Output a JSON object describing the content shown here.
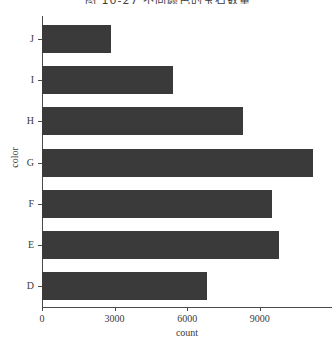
{
  "chart_data": {
    "type": "bar",
    "orientation": "horizontal",
    "title": "图 10-27   不同颜色的宝石数量",
    "xlabel": "count",
    "ylabel": "color",
    "categories": [
      "J",
      "I",
      "H",
      "G",
      "F",
      "E",
      "D"
    ],
    "values": [
      2870,
      5400,
      8300,
      11200,
      9500,
      9790,
      6810
    ],
    "xticks": [
      0,
      3000,
      6000,
      9000
    ],
    "xtick_labels": [
      "0",
      "3000",
      "6000",
      "9000"
    ],
    "xlim": [
      0,
      11900
    ],
    "grid": false,
    "legend": false,
    "bar_color": "#3a3a3a",
    "background_color": "#ffffff",
    "axis_color": "#4a4a4a"
  },
  "axes": {
    "x_title": "count",
    "y_title": "color"
  }
}
